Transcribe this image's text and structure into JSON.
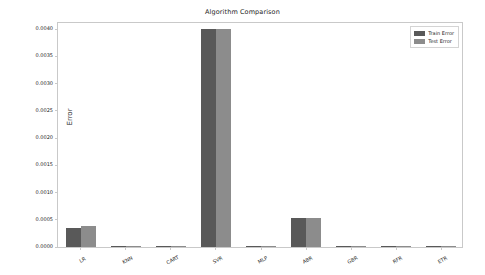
{
  "chart_data": {
    "type": "bar",
    "title": "Algorithm Comparison",
    "xlabel": "",
    "ylabel": "Error",
    "categories": [
      "LR",
      "KNN",
      "CART",
      "SVR",
      "MLP",
      "ABR",
      "GBR",
      "RFR",
      "ETR"
    ],
    "series": [
      {
        "name": "Train Error",
        "color": "#595959",
        "values": [
          0.00034,
          2e-05,
          5e-06,
          0.004,
          1e-05,
          0.00053,
          2e-05,
          2e-06,
          5e-07
        ]
      },
      {
        "name": "Test Error",
        "color": "#8c8c8c",
        "values": [
          0.00039,
          2e-05,
          5e-06,
          0.00401,
          1e-05,
          0.00053,
          2e-05,
          2e-06,
          5e-07
        ]
      }
    ],
    "ylim": [
      0.0,
      0.00415
    ],
    "yticks": [
      0.0,
      0.0005,
      0.001,
      0.0015,
      0.002,
      0.0025,
      0.003,
      0.0035,
      0.004
    ],
    "ytick_labels": [
      "0.0000",
      "0.0005",
      "0.0010",
      "0.0015",
      "0.0020",
      "0.0025",
      "0.0030",
      "0.0035",
      "0.0040"
    ],
    "grid": false,
    "legend_position": "upper right"
  },
  "legend": {
    "entries": [
      {
        "label": "Train Error"
      },
      {
        "label": "Test Error"
      }
    ]
  }
}
